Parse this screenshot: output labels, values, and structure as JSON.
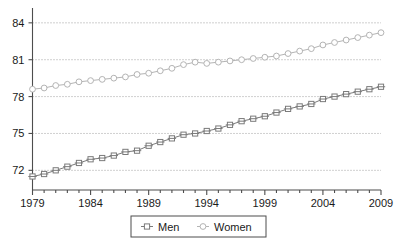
{
  "chart_data": {
    "type": "line",
    "title": "",
    "subtitle": "",
    "xlabel": "",
    "ylabel": "",
    "xlim": [
      1979,
      2009
    ],
    "ylim": [
      70.4,
      84.8
    ],
    "yticks": [
      72,
      75,
      78,
      81,
      84
    ],
    "ytick_labels": [
      "72",
      "75",
      "78",
      "81",
      "84"
    ],
    "xticks": [
      1979,
      1984,
      1989,
      1994,
      1999,
      2004,
      2009
    ],
    "xtick_labels": [
      "1979",
      "1984",
      "1989",
      "1994",
      "1999",
      "2004",
      "2009"
    ],
    "x_minor_ticks": [
      1980,
      1981,
      1982,
      1983,
      1985,
      1986,
      1987,
      1988,
      1990,
      1991,
      1992,
      1993,
      1995,
      1996,
      1997,
      1998,
      2000,
      2001,
      2002,
      2003,
      2005,
      2006,
      2007,
      2008
    ],
    "grid": "horizontal-dotted",
    "legend_position": "bottom-center",
    "x": [
      1979,
      1980,
      1981,
      1982,
      1983,
      1984,
      1985,
      1986,
      1987,
      1988,
      1989,
      1990,
      1991,
      1992,
      1993,
      1994,
      1995,
      1996,
      1997,
      1998,
      1999,
      2000,
      2001,
      2002,
      2003,
      2004,
      2005,
      2006,
      2007,
      2008,
      2009
    ],
    "series": [
      {
        "name": "Men",
        "marker": "square",
        "color": "#7a7a7a",
        "values": [
          71.5,
          71.7,
          72.0,
          72.3,
          72.6,
          72.9,
          73.0,
          73.2,
          73.5,
          73.6,
          74.0,
          74.3,
          74.6,
          74.9,
          75.0,
          75.2,
          75.4,
          75.7,
          76.0,
          76.2,
          76.4,
          76.7,
          77.0,
          77.2,
          77.4,
          77.8,
          78.0,
          78.2,
          78.4,
          78.6,
          78.8
        ]
      },
      {
        "name": "Women",
        "marker": "circle",
        "color": "#b4b4b4",
        "values": [
          78.6,
          78.7,
          78.9,
          79.0,
          79.2,
          79.3,
          79.4,
          79.5,
          79.6,
          79.8,
          79.9,
          80.1,
          80.3,
          80.6,
          80.8,
          80.7,
          80.8,
          80.9,
          81.0,
          81.1,
          81.2,
          81.3,
          81.5,
          81.7,
          81.9,
          82.2,
          82.4,
          82.6,
          82.8,
          83.0,
          83.2
        ]
      }
    ],
    "legend": [
      {
        "label": "Men",
        "marker": "square",
        "color": "#7a7a7a"
      },
      {
        "label": "Women",
        "marker": "circle",
        "color": "#b4b4b4"
      }
    ]
  }
}
